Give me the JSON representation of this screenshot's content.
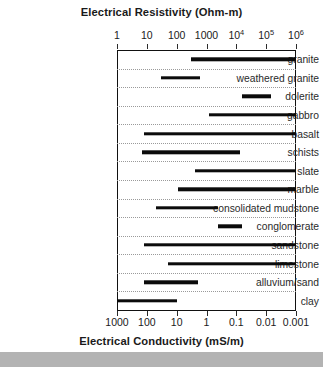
{
  "chart_data": {
    "type": "bar",
    "orientation": "horizontal",
    "title": "Electrical Resistivity (Ohm-m)",
    "xlabel_top": "Electrical Resistivity (Ohm-m)",
    "xlabel_bottom": "Electrical Conductivity (mS/m)",
    "ylabel": "",
    "xscale": "log",
    "xlim_top": [
      1,
      1000000
    ],
    "xlim_bottom": [
      1000,
      0.001
    ],
    "grid": true,
    "grid_style": "dotted horizontal row separators",
    "legend": null,
    "top_ticks": [
      {
        "label": "1",
        "exp": null,
        "value": 1
      },
      {
        "label": "10",
        "exp": null,
        "value": 10
      },
      {
        "label": "100",
        "exp": null,
        "value": 100
      },
      {
        "label": "1000",
        "exp": null,
        "value": 1000
      },
      {
        "label": "10",
        "exp": "4",
        "value": 10000
      },
      {
        "label": "10",
        "exp": "5",
        "value": 100000
      },
      {
        "label": "10",
        "exp": "6",
        "value": 1000000
      }
    ],
    "bottom_ticks": [
      {
        "label": "1000",
        "value": 1000
      },
      {
        "label": "100",
        "value": 100
      },
      {
        "label": "10",
        "value": 10
      },
      {
        "label": "1",
        "value": 1
      },
      {
        "label": "0.1",
        "value": 0.1
      },
      {
        "label": "0.01",
        "value": 0.01
      },
      {
        "label": "0.001",
        "value": 0.001
      }
    ],
    "categories": [
      "granite",
      "weathered granite",
      "dolerite",
      "gabbro",
      "basalt",
      "schists",
      "slate",
      "marble",
      "consolidated mudstone",
      "conglomerate",
      "sandstone",
      "limestone",
      "alluvium/sand",
      "clay"
    ],
    "ranges_resistivity_ohm_m": [
      {
        "category": "granite",
        "min": 300,
        "max": 1000000
      },
      {
        "category": "weathered granite",
        "min": 30,
        "max": 600
      },
      {
        "category": "dolerite",
        "min": 15000,
        "max": 150000
      },
      {
        "category": "gabbro",
        "min": 1200,
        "max": 1000000
      },
      {
        "category": "basalt",
        "min": 8,
        "max": 1000000
      },
      {
        "category": "schists",
        "min": 7,
        "max": 13000
      },
      {
        "category": "slate",
        "min": 400,
        "max": 1000000
      },
      {
        "category": "marble",
        "min": 110,
        "max": 1000000
      },
      {
        "category": "consolidated mudstone",
        "min": 20,
        "max": 2500
      },
      {
        "category": "conglomerate",
        "min": 2500,
        "max": 15000
      },
      {
        "category": "sandstone",
        "min": 8,
        "max": 1000000
      },
      {
        "category": "limestone",
        "min": 50,
        "max": 1000000
      },
      {
        "category": "alluvium/sand",
        "min": 8,
        "max": 500
      },
      {
        "category": "clay",
        "min": 1,
        "max": 100
      }
    ]
  },
  "colors": {
    "bar": "#0b0b0b",
    "axis": "#111111",
    "grid": "#9a9a9a",
    "text": "#1a1a1a",
    "background": "#ffffff",
    "footer_band": "#b3b3b3"
  }
}
